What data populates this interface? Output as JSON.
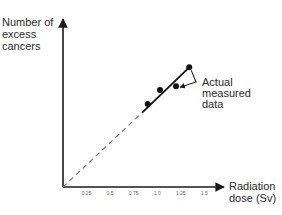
{
  "chart_data": {
    "type": "line",
    "title": "",
    "xlabel": "Radiation dose (Sv)",
    "xlabel_lines": [
      "Radiation",
      "dose (Sv)"
    ],
    "ylabel": "Number of excess cancers",
    "ylabel_lines": [
      "Number of",
      "excess",
      "cancers"
    ],
    "xlim": [
      0,
      1.6
    ],
    "ylim": [
      0,
      1.6
    ],
    "x_ticks": [
      0.25,
      0.5,
      0.75,
      1.0,
      1.25,
      1.5
    ],
    "x_tick_labels": [
      "0.25",
      "0.5",
      "0.75",
      "1.0",
      "1.25",
      "1.5"
    ],
    "y_ticks": [],
    "grid": false,
    "series": [
      {
        "name": "Actual measured data",
        "style": "solid",
        "points": [
          {
            "x": 0.9,
            "y": 0.88
          },
          {
            "x": 1.03,
            "y": 1.03
          },
          {
            "x": 1.2,
            "y": 1.07
          },
          {
            "x": 1.34,
            "y": 1.27
          }
        ],
        "fit_line": [
          {
            "x": 0.84,
            "y": 0.79
          },
          {
            "x": 1.34,
            "y": 1.27
          }
        ]
      },
      {
        "name": "Linear extrapolation",
        "style": "dashed",
        "line": [
          {
            "x": 0.0,
            "y": 0.0
          },
          {
            "x": 0.84,
            "y": 0.79
          }
        ]
      }
    ],
    "annotations": [
      {
        "text_lines": [
          "Actual",
          "measured",
          "data"
        ],
        "points_to": [
          3,
          2
        ]
      }
    ],
    "colors": {
      "axis": "#1a1a1a",
      "data": "#111111",
      "dashed": "#777777"
    }
  }
}
